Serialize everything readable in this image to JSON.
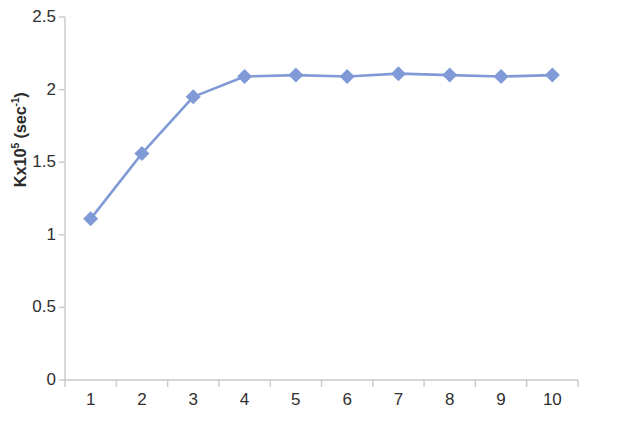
{
  "chart_data": {
    "type": "line",
    "title": "",
    "subtitle": "",
    "xlabel": "Amount of catalyst",
    "ylabel": "Kx10⁵ (sec⁻¹)",
    "ylabel_parts": {
      "base": "Kx10",
      "base_sup": "5",
      "unit_open": " (sec",
      "unit_sup": "-1",
      "unit_close": ")"
    },
    "categories": [
      1,
      2,
      3,
      4,
      5,
      6,
      7,
      8,
      9,
      10
    ],
    "x_tick_labels": [
      "1",
      "2",
      "3",
      "4",
      "5",
      "6",
      "7",
      "8",
      "9",
      "10"
    ],
    "y_tick_labels": [
      "0",
      "0.5",
      "1",
      "1.5",
      "2",
      "2.5"
    ],
    "y_ticks": [
      0,
      0.5,
      1,
      1.5,
      2,
      2.5
    ],
    "values": [
      1.11,
      1.56,
      1.95,
      2.09,
      2.1,
      2.09,
      2.11,
      2.1,
      2.09,
      2.1
    ],
    "series": [
      {
        "name": "Kx10^5 (sec^-1)",
        "values": [
          1.11,
          1.56,
          1.95,
          2.09,
          2.1,
          2.09,
          2.11,
          2.1,
          2.09,
          2.1
        ],
        "color": "#7f9ad6",
        "marker": "diamond"
      }
    ],
    "xlim": [
      0.5,
      10.5
    ],
    "ylim": [
      0,
      2.5
    ],
    "grid": false,
    "legend": false,
    "legend_position": "none",
    "annotations": []
  },
  "style": {
    "line_color": "#7f9ad6",
    "marker_color": "#7f9ad6",
    "axis_color": "#c8c8c8",
    "text_color": "#2f2f2f",
    "background": "#ffffff"
  }
}
